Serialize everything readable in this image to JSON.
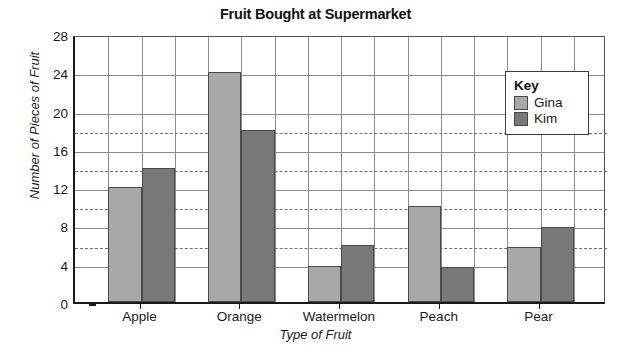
{
  "chart_data": {
    "type": "bar",
    "title": "Fruit Bought at Supermarket",
    "xlabel": "Type of Fruit",
    "ylabel": "Number of Pieces of Fruit",
    "categories": [
      "Apple",
      "Orange",
      "Watermelon",
      "Peach",
      "Pear"
    ],
    "series": [
      {
        "name": "Gina",
        "color": "#a8a8a8",
        "values": [
          12,
          24,
          3.8,
          10,
          5.7
        ]
      },
      {
        "name": "Kim",
        "color": "#787878",
        "values": [
          14,
          18,
          6,
          3.7,
          7.8
        ]
      }
    ],
    "ylim": [
      0,
      28
    ],
    "yticks": [
      0,
      4,
      8,
      12,
      16,
      20,
      24,
      28
    ],
    "yminorticks": [
      2,
      6,
      10,
      14,
      18,
      22,
      26
    ],
    "grid": true,
    "legend_position": "top-right",
    "legend_title": "Key",
    "reference_lines": [
      18,
      14,
      10,
      6
    ]
  },
  "legend": {
    "title": "Key",
    "entries": [
      {
        "label": "Gina",
        "color": "#a8a8a8"
      },
      {
        "label": "Kim",
        "color": "#787878"
      }
    ]
  }
}
